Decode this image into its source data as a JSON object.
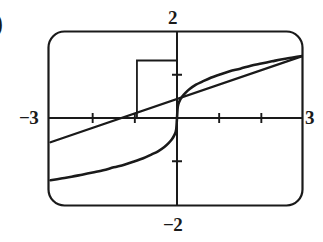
{
  "figure": {
    "item_marker": ")",
    "labels": {
      "y_max": "2",
      "y_min": "−2",
      "x_min": "−3",
      "x_max": "3"
    }
  },
  "chart_data": {
    "type": "line",
    "title": "",
    "xlabel": "",
    "ylabel": "",
    "xlim": [
      -3,
      3
    ],
    "ylim": [
      -2,
      2
    ],
    "grid": false,
    "legend": "none",
    "x_ticks": [
      -3,
      -2,
      -1,
      0,
      1,
      2,
      3
    ],
    "y_ticks": [
      -2,
      -1,
      0,
      1,
      2
    ],
    "x_tick_labels": [
      "−3",
      "",
      "",
      "",
      "",
      "",
      "3"
    ],
    "y_tick_labels": [
      "−2",
      "",
      "",
      "",
      "2"
    ],
    "annotations": [
      {
        "name": "viewing-rectangle",
        "type": "rectangle",
        "x0": -0.95,
        "y0": 0.0,
        "x1": 0.0,
        "y1": 1.33
      }
    ],
    "series": [
      {
        "name": "cube-root-curve",
        "type": "line",
        "x": [
          -3.0,
          -2.75,
          -2.5,
          -2.25,
          -2.0,
          -1.75,
          -1.5,
          -1.25,
          -1.0,
          -0.8,
          -0.6,
          -0.45,
          -0.3,
          -0.2,
          -0.12,
          -0.06,
          -0.02,
          0.0,
          0.02,
          0.06,
          0.12,
          0.2,
          0.3,
          0.45,
          0.6,
          0.8,
          1.0,
          1.25,
          1.5,
          1.75,
          2.0,
          2.25,
          2.5,
          2.75,
          3.0
        ],
        "y": [
          -1.44,
          -1.4,
          -1.36,
          -1.31,
          -1.26,
          -1.21,
          -1.14,
          -1.08,
          -1.0,
          -0.93,
          -0.84,
          -0.77,
          -0.67,
          -0.58,
          -0.49,
          -0.39,
          -0.27,
          0.0,
          0.27,
          0.39,
          0.49,
          0.58,
          0.67,
          0.77,
          0.84,
          0.93,
          1.0,
          1.08,
          1.14,
          1.21,
          1.26,
          1.31,
          1.36,
          1.4,
          1.44
        ]
      },
      {
        "name": "secant-line",
        "type": "line",
        "x": [
          -3.0,
          3.0
        ],
        "y": [
          -0.56,
          1.44
        ]
      }
    ]
  }
}
